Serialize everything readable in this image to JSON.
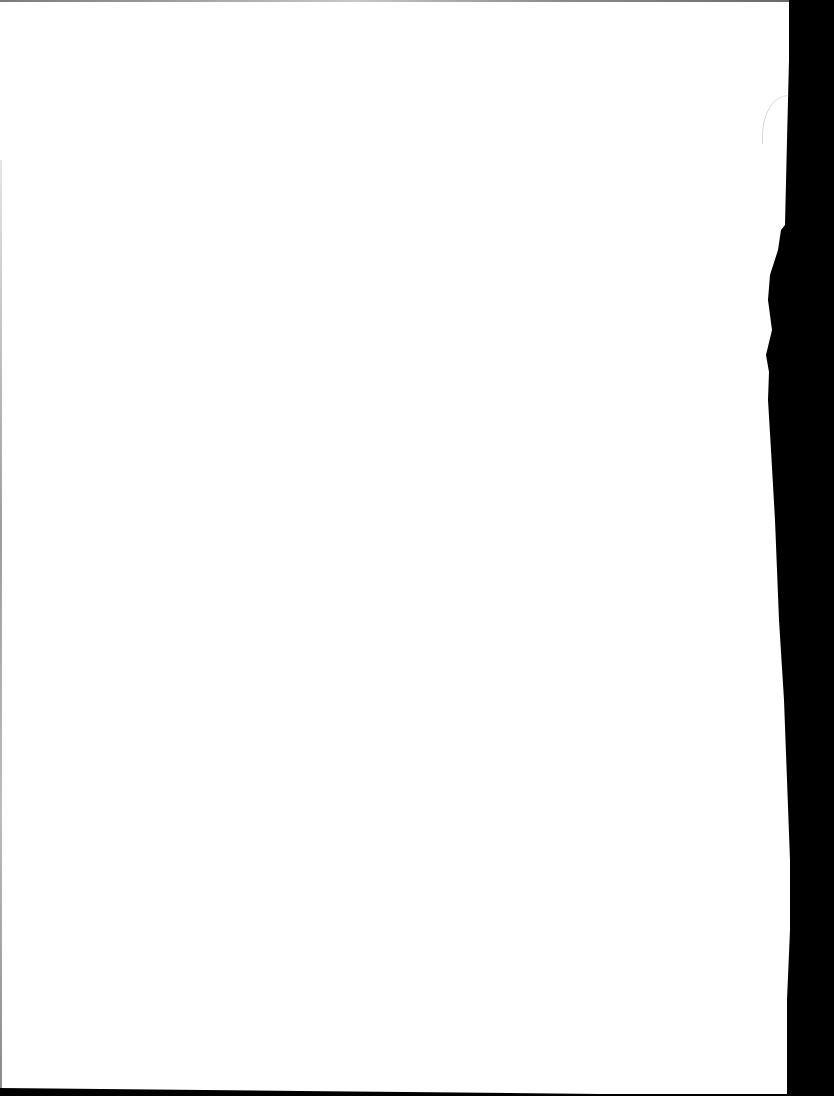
{
  "document": {
    "type": "scanned-page",
    "content": "",
    "background_color": "#ffffff",
    "scanner_bed_color": "#000000"
  }
}
